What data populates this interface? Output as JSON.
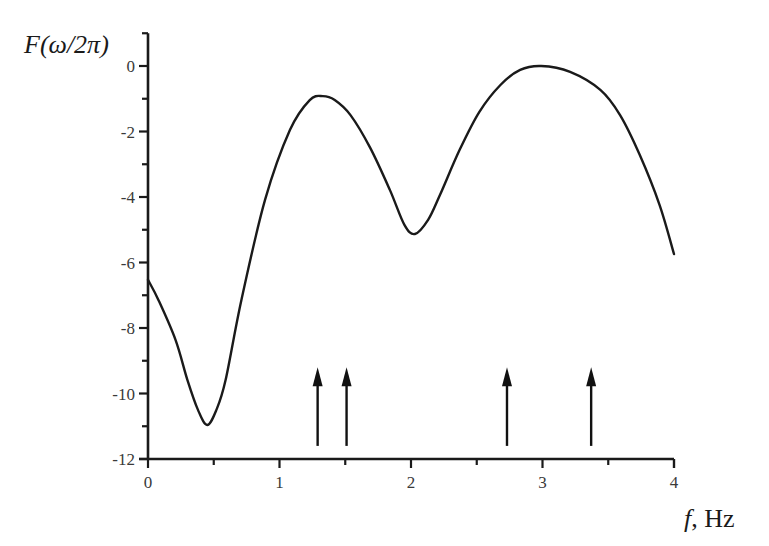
{
  "chart_data": {
    "type": "line",
    "title": "",
    "xlabel": "f, Hz",
    "xlabel_italic_part": "f",
    "xlabel_rest": ", Hz",
    "ylabel": "F(ω/2π)",
    "xlim": [
      0,
      4
    ],
    "ylim": [
      -12,
      1
    ],
    "grid": false,
    "legend": null,
    "x_ticks": [
      0,
      1,
      2,
      3,
      4
    ],
    "x_tick_labels": [
      "0",
      "1",
      "2",
      "3",
      "4"
    ],
    "x_minor_ticks": [
      0.5,
      1.5,
      2.5,
      3.5
    ],
    "y_ticks": [
      0,
      -2,
      -4,
      -6,
      -8,
      -10,
      -12
    ],
    "y_tick_labels": [
      "0",
      "-2",
      "-4",
      "-6",
      "-8",
      "-10",
      "-12"
    ],
    "y_minor_ticks": [
      1,
      -1,
      -3,
      -5,
      -7,
      -9,
      -11
    ],
    "series": [
      {
        "name": "F(ω/2π)",
        "color": "#1a1a1a",
        "x": [
          0,
          0.08,
          0.21,
          0.3,
          0.38,
          0.45,
          0.52,
          0.59,
          0.71,
          0.89,
          1.08,
          1.23,
          1.33,
          1.42,
          1.54,
          1.69,
          1.84,
          1.95,
          2.03,
          2.13,
          2.22,
          2.37,
          2.52,
          2.68,
          2.83,
          2.99,
          3.21,
          3.44,
          3.59,
          3.74,
          3.89,
          4.0
        ],
        "y": [
          -6.53,
          -7.15,
          -8.37,
          -9.59,
          -10.5,
          -10.96,
          -10.5,
          -9.59,
          -7.15,
          -4.09,
          -1.95,
          -1.04,
          -0.92,
          -1.04,
          -1.5,
          -2.5,
          -3.79,
          -4.85,
          -5.13,
          -4.7,
          -3.94,
          -2.56,
          -1.4,
          -0.58,
          -0.12,
          0.0,
          -0.18,
          -0.73,
          -1.5,
          -2.72,
          -4.24,
          -5.74
        ]
      }
    ],
    "annotations": {
      "arrows": [
        {
          "x": 1.29,
          "y_base": -11.6,
          "y_tip": -9.2,
          "direction": "up"
        },
        {
          "x": 1.51,
          "y_base": -11.6,
          "y_tip": -9.2,
          "direction": "up"
        },
        {
          "x": 2.73,
          "y_base": -11.6,
          "y_tip": -9.2,
          "direction": "up"
        },
        {
          "x": 3.37,
          "y_base": -11.6,
          "y_tip": -9.2,
          "direction": "up"
        }
      ]
    },
    "extrema": {
      "min1": {
        "x": 0.45,
        "y": -10.96
      },
      "max1": {
        "x": 1.33,
        "y": -0.92
      },
      "min2": {
        "x": 2.03,
        "y": -5.13
      },
      "max2": {
        "x": 2.99,
        "y": 0.0
      }
    }
  },
  "layout": {
    "plot_left_px": 148,
    "plot_right_px": 674,
    "y_zero_px": 66,
    "px_per_x": 131.5,
    "px_per_y": 32.75
  }
}
